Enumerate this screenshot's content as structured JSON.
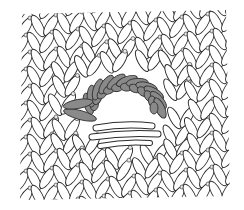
{
  "figure": {
    "colors": {
      "background": "#ffffff",
      "stitch_fill": "#ffffff",
      "stitch_outline": "#2a2a2a",
      "highlighted_loops": "#8a8a8a",
      "highlighted_outline": "#333333"
    },
    "hole": {
      "cx": 124,
      "cy": 108,
      "rx": 26,
      "ry": 18
    },
    "bounds": {
      "x": 17,
      "y": 8,
      "width": 213,
      "height": 192
    },
    "highlighted_loop_count": 11
  }
}
